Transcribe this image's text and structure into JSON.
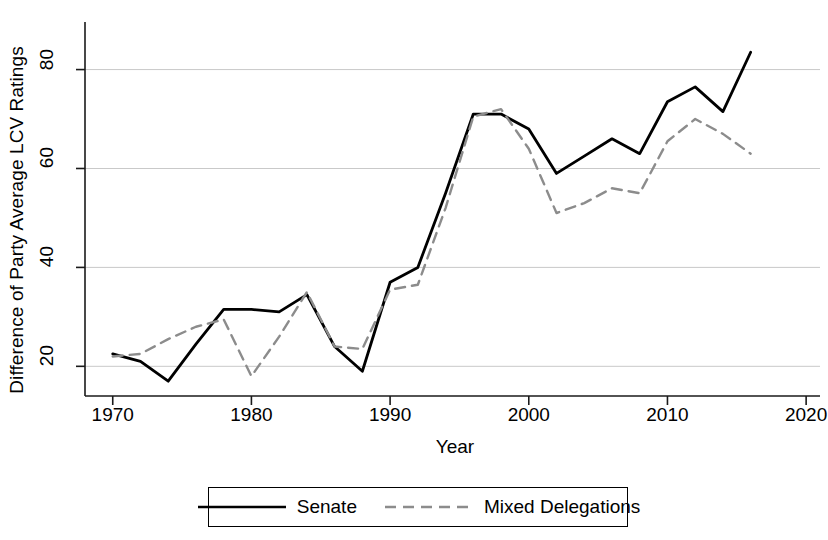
{
  "chart_data": {
    "type": "line",
    "title": "",
    "xlabel": "Year",
    "ylabel": "Difference of Party Average LCV Ratings",
    "xlim": [
      1968,
      2021
    ],
    "ylim": [
      14,
      88
    ],
    "xticks": [
      1970,
      1980,
      1990,
      2000,
      2010,
      2020
    ],
    "yticks": [
      20,
      40,
      60,
      80
    ],
    "grid": "horizontal",
    "legend_position": "bottom-center",
    "x": [
      1970,
      1972,
      1974,
      1976,
      1978,
      1980,
      1982,
      1984,
      1986,
      1988,
      1990,
      1992,
      1994,
      1996,
      1998,
      2000,
      2002,
      2004,
      2006,
      2008,
      2010,
      2012,
      2014,
      2016
    ],
    "series": [
      {
        "name": "Senate",
        "style": "solid",
        "color": "#000000",
        "values": [
          22.5,
          21.0,
          17.0,
          24.5,
          31.5,
          31.5,
          31.0,
          34.5,
          24.0,
          19.0,
          37.0,
          40.0,
          55.0,
          71.0,
          71.0,
          68.0,
          59.0,
          62.5,
          66.0,
          63.0,
          73.5,
          76.5,
          71.5,
          83.5
        ]
      },
      {
        "name": "Mixed Delegations",
        "style": "dashed",
        "color": "#8c8c8c",
        "values": [
          22.0,
          22.5,
          25.5,
          28.0,
          29.5,
          18.0,
          26.0,
          35.0,
          24.0,
          23.5,
          35.5,
          36.5,
          52.0,
          70.5,
          72.0,
          64.0,
          51.0,
          53.0,
          56.0,
          55.0,
          65.5,
          70.0,
          67.0,
          63.0
        ]
      }
    ]
  },
  "legend": {
    "entries": [
      {
        "label": "Senate"
      },
      {
        "label": "Mixed Delegations"
      }
    ]
  }
}
